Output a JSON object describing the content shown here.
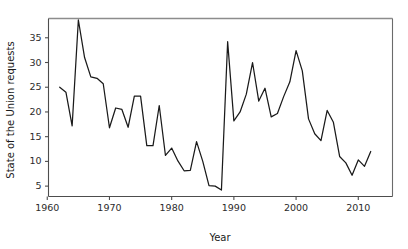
{
  "chart_data": {
    "type": "line",
    "title": "",
    "xlabel": "Year",
    "ylabel": "State of the Union requests",
    "xlim": [
      1960.2,
      2015.5
    ],
    "ylim": [
      2.9,
      38.9
    ],
    "xticks": [
      1960,
      1970,
      1980,
      1990,
      2000,
      2010
    ],
    "xticklabels": [
      "1960",
      "1970",
      "1980",
      "1990",
      "2000",
      "2010"
    ],
    "yticks": [
      5,
      10,
      15,
      20,
      25,
      30,
      35
    ],
    "yticklabels": [
      "5",
      "10",
      "15",
      "20",
      "25",
      "30",
      "35"
    ],
    "grid": false,
    "legend": false,
    "series": [
      {
        "name": "State of the Union requests",
        "color": "#1a1a1a",
        "x": [
          1962,
          1963,
          1964,
          1965,
          1966,
          1967,
          1968,
          1969,
          1970,
          1971,
          1972,
          1973,
          1974,
          1975,
          1976,
          1977,
          1978,
          1979,
          1980,
          1981,
          1982,
          1983,
          1984,
          1985,
          1986,
          1987,
          1988,
          1989,
          1990,
          1991,
          1992,
          1993,
          1994,
          1995,
          1996,
          1997,
          1998,
          1999,
          2000,
          2001,
          2002,
          2003,
          2004,
          2005,
          2006,
          2007,
          2008,
          2009,
          2010,
          2011,
          2012
        ],
        "values": [
          25,
          24,
          17.2,
          38.6,
          31,
          27.1,
          26.8,
          25.7,
          16.8,
          20.8,
          20.5,
          16.9,
          23.2,
          23.2,
          13.2,
          13.2,
          21.3,
          11.2,
          12.7,
          10.1,
          8.1,
          8.2,
          14,
          10,
          5.1,
          5,
          4.2,
          34.2,
          18.2,
          20,
          23.6,
          30,
          22.2,
          24.8,
          19,
          19.7,
          23.1,
          26.1,
          32.4,
          28.3,
          18.6,
          15.6,
          14.2,
          20.3,
          17.9,
          11,
          9.7,
          7.2,
          10.3,
          9,
          12
        ]
      }
    ]
  },
  "axes": {
    "xlabel": "Year",
    "ylabel": "State of the Union requests"
  }
}
